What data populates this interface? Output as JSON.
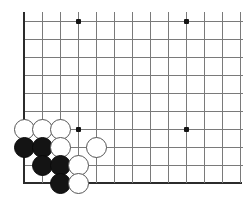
{
  "figure": {
    "title": "Go board corner position",
    "board_size": 19,
    "view": "bottom-left corner, cropped"
  },
  "board": {
    "cell_size": 18,
    "origin_x": 24,
    "origin_y": 21,
    "cols": 13,
    "rows": 10,
    "left_edge_is_board_edge": true,
    "bottom_edge_is_board_edge": true,
    "line_color": "#7a7a7a",
    "edge_color": "#2b2b2b",
    "background_color": "#ffffff"
  },
  "star_points": [
    {
      "name": "star-point-upper-left",
      "col": 3,
      "row": 0
    },
    {
      "name": "star-point-upper-right",
      "col": 9,
      "row": 0
    },
    {
      "name": "star-point-lower-left",
      "col": 3,
      "row": 6
    },
    {
      "name": "star-point-lower-right",
      "col": 9,
      "row": 6
    }
  ],
  "stones": [
    {
      "id": "stone-1",
      "color": "white",
      "col": 0,
      "row": 6
    },
    {
      "id": "stone-2",
      "color": "white",
      "col": 1,
      "row": 6
    },
    {
      "id": "stone-3",
      "color": "white",
      "col": 2,
      "row": 6
    },
    {
      "id": "stone-4",
      "color": "black",
      "col": 0,
      "row": 7
    },
    {
      "id": "stone-5",
      "color": "black",
      "col": 1,
      "row": 7
    },
    {
      "id": "stone-6",
      "color": "white",
      "col": 2,
      "row": 7
    },
    {
      "id": "stone-7",
      "color": "white",
      "col": 4,
      "row": 7
    },
    {
      "id": "stone-8",
      "color": "black",
      "col": 1,
      "row": 8
    },
    {
      "id": "stone-9",
      "color": "black",
      "col": 2,
      "row": 8
    },
    {
      "id": "stone-10",
      "color": "white",
      "col": 3,
      "row": 8
    },
    {
      "id": "stone-11",
      "color": "black",
      "col": 2,
      "row": 9
    },
    {
      "id": "stone-12",
      "color": "white",
      "col": 3,
      "row": 9
    }
  ],
  "colors": {
    "black_stone": "#141414",
    "white_stone": "#ffffff",
    "white_stone_outline": "#555555",
    "grid": "#7a7a7a",
    "edge": "#2b2b2b"
  }
}
